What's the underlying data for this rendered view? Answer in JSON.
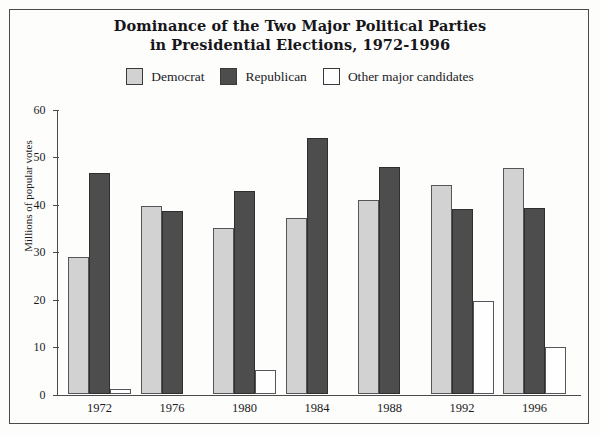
{
  "chart_data": {
    "type": "bar",
    "title": "Dominance of the Two Major Political Parties in Presidential Elections, 1972-1996",
    "title_line1": "Dominance of the Two Major Political Parties",
    "title_line2": "in Presidential Elections, 1972-1996",
    "xlabel": "",
    "ylabel": "Millions of popular votes",
    "ylim": [
      0,
      60
    ],
    "ytick_values": [
      0,
      10,
      20,
      30,
      40,
      50,
      60
    ],
    "ytick_labels": [
      "0",
      "10",
      "20",
      "30",
      "40",
      "50",
      "60"
    ],
    "grid": false,
    "legend_position": "top-center",
    "categories": [
      "1972",
      "1976",
      "1980",
      "1984",
      "1988",
      "1992",
      "1996"
    ],
    "series": [
      {
        "name": "Democrat",
        "color": "#d2d2d2",
        "values": [
          29,
          39.8,
          35.2,
          37.2,
          41,
          44.2,
          47.8
        ]
      },
      {
        "name": "Republican",
        "color": "#4d4d4d",
        "values": [
          46.7,
          38.8,
          43,
          54.2,
          48,
          39.1,
          39.4
        ]
      },
      {
        "name": "Other major candidates",
        "color": "#fefefe",
        "values": [
          1.1,
          0,
          5.1,
          0,
          0,
          19.7,
          10
        ]
      }
    ]
  },
  "legend": {
    "items": [
      {
        "label": "Democrat",
        "swatch": "#d2d2d2"
      },
      {
        "label": "Republican",
        "swatch": "#4d4d4d"
      },
      {
        "label": "Other major candidates",
        "swatch": "#fefefe"
      }
    ]
  },
  "colors": {
    "democrat": "#d2d2d2",
    "republican": "#4d4d4d",
    "other": "#fefefe",
    "axis": "#4a4a4a",
    "border": "#4a4a4a",
    "background": "#fdfdfc",
    "text": "#1b1b1f"
  }
}
